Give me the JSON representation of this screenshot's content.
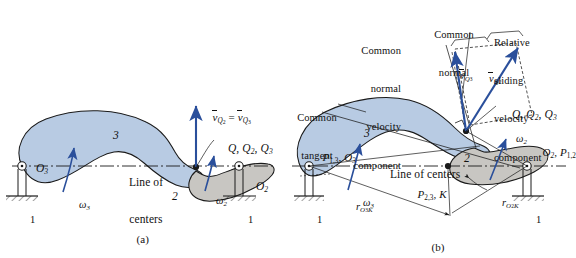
{
  "figure": {
    "title_a": "(a)",
    "title_b": "(b)",
    "colors": {
      "body3_fill": "#b8cbe3",
      "body2_fill": "#c8c6c2",
      "vector_blue": "#2a4f9b",
      "outline": "#1a1a1a",
      "background": "#ffffff"
    }
  },
  "panel_a": {
    "caption": "(a)",
    "body_labels": {
      "link3": "3",
      "link2": "2"
    },
    "ground_labels": {
      "left": "1",
      "right": "1"
    },
    "pivots": {
      "left": "O",
      "left_sub": "3",
      "right": "O",
      "right_sub": "2"
    },
    "omega": {
      "left": "ω",
      "left_sub": "3",
      "right": "ω",
      "right_sub": "2"
    },
    "velocity_label": {
      "v1": "v",
      "v1_sub": "Q",
      "v1_sub2": "2",
      "eq": " = ",
      "v2": "v",
      "v2_sub": "Q",
      "v2_sub2": "3"
    },
    "contact_point_label": {
      "q": "Q",
      "q2": "Q",
      "q2_sub": "2",
      "q3": "Q",
      "q3_sub": "3"
    },
    "line_of_centers": {
      "line1": "Line of",
      "line2": "centers"
    }
  },
  "panel_b": {
    "caption": "(b)",
    "body_labels": {
      "link3": "3",
      "link2": "2"
    },
    "ground_labels": {
      "left": "1",
      "right": "1"
    },
    "annotations": {
      "common_normal_velocity_component": [
        "Common",
        "normal",
        "velocity",
        "component"
      ],
      "common_normal": [
        "Common",
        "normal"
      ],
      "relative_sliding_velocity_component": [
        "Relative",
        "sliding",
        "velocity",
        "component"
      ],
      "common_tangent": [
        "Common",
        "tangent"
      ],
      "line_of_centers": "Line of centers"
    },
    "velocity_vectors": [
      {
        "name": "v",
        "sub": "Q",
        "sub2": "3"
      },
      {
        "name": "v",
        "sub": "Q",
        "sub2": "2"
      }
    ],
    "contact_point_label": {
      "q": "Q",
      "q2": "Q",
      "q2_sub": "2",
      "q3": "Q",
      "q3_sub": "3"
    },
    "instant_centers": {
      "left": {
        "p": "P",
        "p_sub": "1,3",
        "o": "O",
        "o_sub": "3"
      },
      "right": {
        "o": "O",
        "o_sub": "2",
        "p": "P",
        "p_sub": "1,2"
      },
      "mid": {
        "p": "P",
        "p_sub": "2,3",
        "k": "K"
      }
    },
    "omega": {
      "left": "ω",
      "left_sub": "3",
      "right": "ω",
      "right_sub": "2"
    },
    "radii": [
      {
        "r": "r",
        "sub": "O",
        "sub_num": "3",
        "sub_tail": "K"
      },
      {
        "r": "r",
        "sub": "O",
        "sub_num": "2",
        "sub_tail": "K"
      }
    ]
  }
}
